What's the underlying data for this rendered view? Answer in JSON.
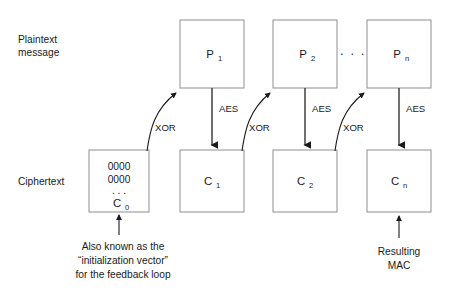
{
  "diagram": {
    "row_labels": [
      {
        "id": "plaintext",
        "line1": "Plaintext",
        "line2": "message"
      },
      {
        "id": "ciphertext",
        "line1": "Ciphertext",
        "line2": ""
      }
    ],
    "plaintext_blocks": [
      {
        "id": "p1",
        "label": "P",
        "sub": "1"
      },
      {
        "id": "p2",
        "label": "P",
        "sub": "2"
      },
      {
        "id": "pn",
        "label": "P",
        "sub": "n"
      }
    ],
    "ciphertext_blocks": [
      {
        "id": "c0",
        "label": "C",
        "sub": "0"
      },
      {
        "id": "c1",
        "label": "C",
        "sub": "1"
      },
      {
        "id": "c2",
        "label": "C",
        "sub": "2"
      },
      {
        "id": "cn",
        "label": "C",
        "sub": "n"
      }
    ],
    "iv_block": {
      "line1": "0000",
      "line2": "0000",
      "line3": ". . .",
      "label": "C",
      "sub": "0"
    },
    "aes_labels": [
      {
        "id": "aes-1",
        "text": "AES"
      },
      {
        "id": "aes-2",
        "text": "AES"
      },
      {
        "id": "aes-n",
        "text": "AES"
      }
    ],
    "xor_labels": [
      {
        "id": "xor-1",
        "text": "XOR"
      },
      {
        "id": "xor-2",
        "text": "XOR"
      },
      {
        "id": "xor-n",
        "text": "XOR"
      }
    ],
    "ellipsis": {
      "plaintext_row": ". . ."
    },
    "iv_caption": {
      "line1": "Also known as the",
      "line2": "“initialization vector”",
      "line3": "for the feedback loop"
    },
    "mac_caption": {
      "line1": "Resulting",
      "line2": "MAC"
    },
    "colors": {
      "background": "#ffffff",
      "box_stroke": "#9a9a9a",
      "line": "#1a1a1a",
      "text": "#1a1a1a"
    }
  }
}
